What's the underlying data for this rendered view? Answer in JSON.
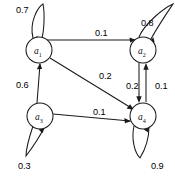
{
  "figure": {
    "type": "state-transition-diagram"
  },
  "nodes": [
    {
      "id": "a1",
      "label": "a",
      "subscript": "1",
      "cx": 39,
      "cy": 50,
      "r": 13
    },
    {
      "id": "a2",
      "label": "a",
      "subscript": "2",
      "cx": 143,
      "cy": 50,
      "r": 13
    },
    {
      "id": "a3",
      "label": "a",
      "subscript": "3",
      "cx": 40,
      "cy": 116,
      "r": 13
    },
    {
      "id": "a4",
      "label": "a",
      "subscript": "4",
      "cx": 143,
      "cy": 116,
      "r": 13
    }
  ],
  "edges": [
    {
      "id": "a1-a1",
      "from": "a1",
      "to": "a1",
      "weight": "0.7",
      "kind": "self-loop",
      "label_x": 16,
      "label_y": 5
    },
    {
      "id": "a2-a2",
      "from": "a2",
      "to": "a2",
      "weight": "0.8",
      "kind": "self-loop",
      "label_x": 141,
      "label_y": 18
    },
    {
      "id": "a3-a3",
      "from": "a3",
      "to": "a3",
      "weight": "0.3",
      "kind": "self-loop",
      "label_x": 18,
      "label_y": 161
    },
    {
      "id": "a4-a4",
      "from": "a4",
      "to": "a4",
      "weight": "0.9",
      "kind": "self-loop",
      "label_x": 151,
      "label_y": 161
    },
    {
      "id": "a1-a2",
      "from": "a1",
      "to": "a2",
      "weight": "0.1",
      "kind": "straight",
      "label_x": 95,
      "label_y": 28
    },
    {
      "id": "a1-a4",
      "from": "a1",
      "to": "a4",
      "weight": "0.2",
      "kind": "straight",
      "label_x": 99,
      "label_y": 71
    },
    {
      "id": "a3-a1",
      "from": "a3",
      "to": "a1",
      "weight": "0.6",
      "kind": "straight",
      "label_x": 16,
      "label_y": 80
    },
    {
      "id": "a3-a4",
      "from": "a3",
      "to": "a4",
      "weight": "0.1",
      "kind": "straight",
      "label_x": 93,
      "label_y": 107
    },
    {
      "id": "a2-a4",
      "from": "a2",
      "to": "a4",
      "weight": "0.2",
      "kind": "parallel-down",
      "label_x": 126,
      "label_y": 81
    },
    {
      "id": "a4-a2",
      "from": "a4",
      "to": "a2",
      "weight": "0.1",
      "kind": "parallel-up",
      "label_x": 155,
      "label_y": 81
    }
  ],
  "colors": {
    "stroke": "#1a1a1a",
    "text": "#111111",
    "background": "#ffffff"
  }
}
